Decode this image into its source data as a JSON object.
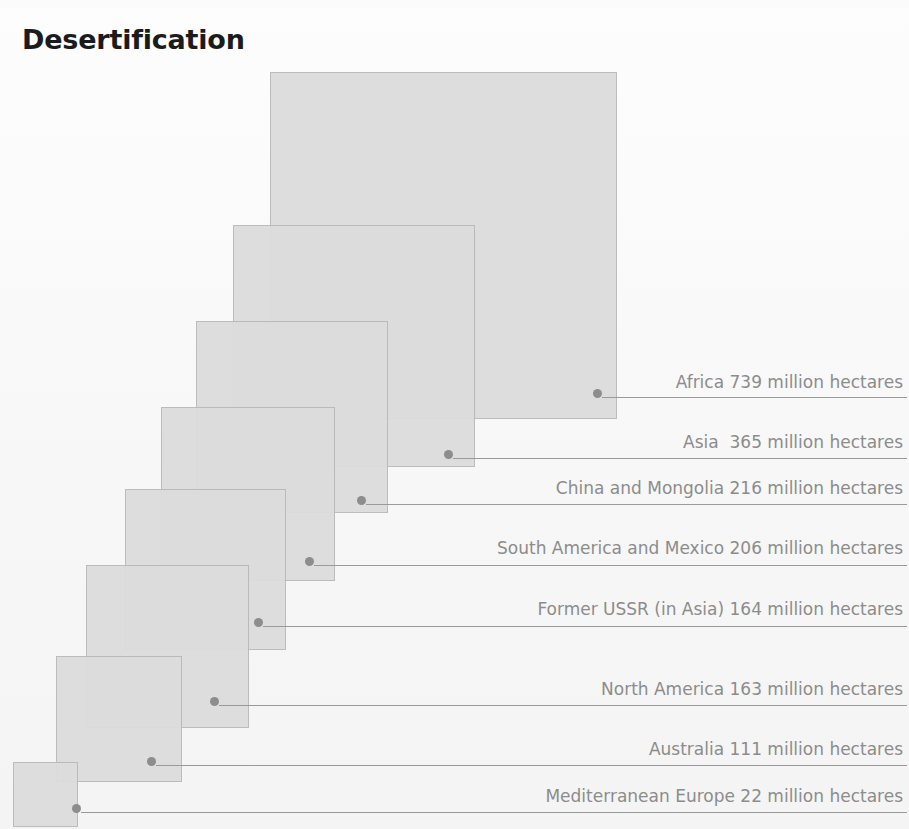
{
  "title": "Desertification",
  "unit": "million hectares",
  "colors": {
    "square_fill": "#dcdcdc",
    "square_border": "#b9b9b9",
    "label_text": "#8c8c8c",
    "leader_line": "#9a9a9a",
    "title_text": "#1b1b1b",
    "background": "#fbfbfb"
  },
  "chart_data": {
    "type": "area",
    "title": "Desertification",
    "xlabel": "",
    "ylabel": "",
    "unit": "million hectares",
    "categories": [
      "Africa",
      "Asia",
      "China and Mongolia",
      "South America and Mexico",
      "Former USSR (in Asia)",
      "North America",
      "Australia",
      "Mediterranean Europe"
    ],
    "values": [
      739,
      365,
      216,
      206,
      164,
      163,
      111,
      22
    ],
    "labels": [
      "Africa 739 million hectares",
      "Asia  365 million hectares",
      "China and Mongolia 216 million hectares",
      "South America and Mexico 206 million hectares",
      "Former USSR (in Asia) 164 million hectares",
      "North America 163 million hectares",
      "Australia 111 million hectares",
      "Mediterranean Europe 22 million hectares"
    ],
    "legend_position": "right",
    "grid": false,
    "note": "Nested squares; square area proportional to value"
  },
  "squares": [
    {
      "name": "africa",
      "label": "Africa 739 million hectares",
      "value": 739,
      "x": 270,
      "y": 72,
      "size": 347,
      "dot_x": 597,
      "dot_y": 393,
      "leader_x": 602,
      "leader_w": 305,
      "leader_y": 397,
      "label_y": 372
    },
    {
      "name": "asia",
      "label": "Asia  365 million hectares",
      "value": 365,
      "x": 233,
      "y": 225,
      "size": 242,
      "dot_x": 448,
      "dot_y": 454,
      "leader_x": 453,
      "leader_w": 454,
      "leader_y": 458,
      "label_y": 432
    },
    {
      "name": "china-and-mongolia",
      "label": "China and Mongolia 216 million hectares",
      "value": 216,
      "x": 196,
      "y": 321,
      "size": 192,
      "dot_x": 361,
      "dot_y": 500,
      "leader_x": 366,
      "leader_w": 541,
      "leader_y": 504,
      "label_y": 478
    },
    {
      "name": "south-america-and-mexico",
      "label": "South America and Mexico 206 million hectares",
      "value": 206,
      "x": 161,
      "y": 407,
      "size": 174,
      "dot_x": 309,
      "dot_y": 561,
      "leader_x": 314,
      "leader_w": 593,
      "leader_y": 565,
      "label_y": 538
    },
    {
      "name": "former-ussr-in-asia",
      "label": "Former USSR (in Asia) 164 million hectares",
      "value": 164,
      "x": 125,
      "y": 489,
      "size": 161,
      "dot_x": 258,
      "dot_y": 622,
      "leader_x": 263,
      "leader_w": 644,
      "leader_y": 626,
      "label_y": 599
    },
    {
      "name": "north-america",
      "label": "North America 163 million hectares",
      "value": 163,
      "x": 86,
      "y": 565,
      "size": 163,
      "dot_x": 214,
      "dot_y": 701,
      "leader_x": 219,
      "leader_w": 688,
      "leader_y": 705,
      "label_y": 679
    },
    {
      "name": "australia",
      "label": "Australia 111 million hectares",
      "value": 111,
      "x": 56,
      "y": 656,
      "size": 126,
      "dot_x": 151,
      "dot_y": 761,
      "leader_x": 156,
      "leader_w": 751,
      "leader_y": 765,
      "label_y": 739
    },
    {
      "name": "mediterranean-europe",
      "label": "Mediterranean Europe 22 million hectares",
      "value": 22,
      "x": 13,
      "y": 762,
      "size": 65,
      "dot_x": 76,
      "dot_y": 808,
      "leader_x": 81,
      "leader_w": 826,
      "leader_y": 812,
      "label_y": 786
    }
  ]
}
